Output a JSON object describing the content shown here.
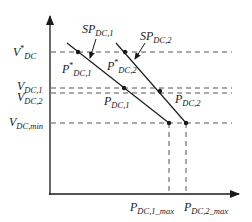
{
  "diagram": {
    "type": "droop-characteristic",
    "y_axis": {
      "name": "voltage"
    },
    "x_axis": {
      "name": "power"
    },
    "y_levels": [
      {
        "id": "vdc_ref",
        "base": "V",
        "sup": "*",
        "sub": "DC"
      },
      {
        "id": "vdc1",
        "base": "V",
        "sub": "DC,1"
      },
      {
        "id": "vdc2",
        "base": "V",
        "sub": "DC,2"
      },
      {
        "id": "vdc_min",
        "base": "V",
        "sub": "DC,min"
      }
    ],
    "x_levels": [
      {
        "id": "pdc1_max",
        "base": "P",
        "sub": "DC,1_max"
      },
      {
        "id": "pdc2_max",
        "base": "P",
        "sub": "DC,2_max"
      }
    ],
    "droop_lines": [
      {
        "id": "line1",
        "setpoint_label": {
          "base": "SP",
          "sub": "DC,1"
        },
        "ref_point_label": {
          "base": "P",
          "sup": "*",
          "sub": "DC,1"
        },
        "op_point_label": {
          "base": "P",
          "sub": "DC,1"
        }
      },
      {
        "id": "line2",
        "setpoint_label": {
          "base": "SP",
          "sub": "DC,2"
        },
        "ref_point_label": {
          "base": "P",
          "sup": "*",
          "sub": "DC,2"
        },
        "op_point_label": {
          "base": "P",
          "sub": "DC,2"
        }
      }
    ],
    "colors": {
      "line": "#1a1a1a",
      "dash": "#555555"
    }
  }
}
